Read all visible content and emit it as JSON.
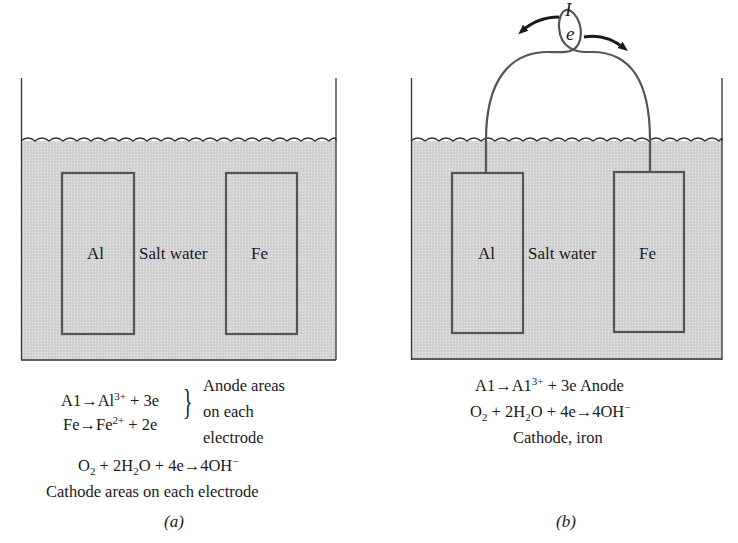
{
  "figure": {
    "panel_a": {
      "caption": "(a)",
      "electrode_left": "Al",
      "electrode_right": "Fe",
      "electrolyte": "Salt water",
      "reactions": {
        "anode_1": {
          "lhs": "A1→Al",
          "charge": "3+",
          "rhs": " + 3e"
        },
        "anode_2": {
          "lhs": "Fe→Fe",
          "charge": "2+",
          "rhs": " + 2e"
        },
        "anode_note_1": "Anode areas",
        "anode_note_2": "on each",
        "anode_note_3": "electrode",
        "cathode": {
          "o": "O",
          "o_sub": "2",
          "mid1": " + 2H",
          "h_sub": "2",
          "mid2": "O + 4e→4OH",
          "charge": "−"
        },
        "cathode_note": "Cathode areas on each electrode"
      }
    },
    "panel_b": {
      "caption": "(b)",
      "electrode_left": "Al",
      "electrode_right": "Fe",
      "electrolyte": "Salt water",
      "current_label": "I",
      "electron_label": "e",
      "reactions": {
        "anode": {
          "lhs": "A1→A1",
          "charge": "3+",
          "rhs": " + 3e Anode"
        },
        "cathode": {
          "o": "O",
          "o_sub": "2",
          "mid1": " + 2H",
          "h_sub": "2",
          "mid2": "O + 4e→4OH",
          "charge": "−"
        },
        "cathode_note": "Cathode, iron"
      }
    },
    "colors": {
      "water": "#d4d4d4",
      "outline": "#555555",
      "wall": "#333333"
    }
  }
}
